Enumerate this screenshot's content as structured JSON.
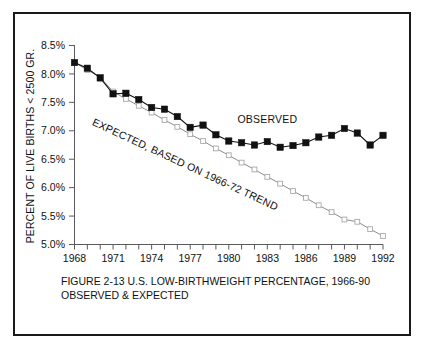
{
  "figure": {
    "caption_line1": "FIGURE 2-13  U.S. LOW-BIRTHWEIGHT PERCENTAGE, 1966-90",
    "caption_line2": "OBSERVED & EXPECTED"
  },
  "chart_data": {
    "type": "line",
    "title": "",
    "xlabel": "",
    "ylabel": "PERCENT OF LIVE BIRTHS < 2500 GR.",
    "xlim": [
      1968,
      1992
    ],
    "ylim": [
      5.0,
      8.5
    ],
    "ytick_labels": [
      "8.5%",
      "8.0%",
      "7.5%",
      "7.0%",
      "6.5%",
      "6.0%",
      "5.5%",
      "5.0%"
    ],
    "ytick_values": [
      8.5,
      8.0,
      7.5,
      7.0,
      6.5,
      6.0,
      5.5,
      5.0
    ],
    "xtick_labels": [
      "1968",
      "1971",
      "1974",
      "1977",
      "1980",
      "1983",
      "1986",
      "1989",
      "1992"
    ],
    "xtick_values": [
      1968,
      1971,
      1974,
      1977,
      1980,
      1983,
      1986,
      1989,
      1992
    ],
    "xminor_values": [
      1968,
      1969,
      1970,
      1971,
      1972,
      1973,
      1974,
      1975,
      1976,
      1977,
      1978,
      1979,
      1980,
      1981,
      1982,
      1983,
      1984,
      1985,
      1986,
      1987,
      1988,
      1989,
      1990,
      1991,
      1992
    ],
    "grid": false,
    "legend_position": "inline-annotation",
    "annotations": [
      {
        "text": "OBSERVED",
        "x": 1983.0,
        "y": 7.13,
        "rotation": 0
      },
      {
        "text": "EXPECTED, BASED ON 1966-72 TREND",
        "x": 1976.5,
        "y": 6.35,
        "rotation": 25
      }
    ],
    "x": [
      1968,
      1969,
      1970,
      1971,
      1972,
      1973,
      1974,
      1975,
      1976,
      1977,
      1978,
      1979,
      1980,
      1981,
      1982,
      1983,
      1984,
      1985,
      1986,
      1987,
      1988,
      1989,
      1990,
      1991,
      1992
    ],
    "series": [
      {
        "name": "OBSERVED",
        "marker": "filled-square",
        "color": "#111111",
        "values": [
          8.2,
          8.1,
          7.93,
          7.65,
          7.66,
          7.55,
          7.41,
          7.38,
          7.25,
          7.06,
          7.1,
          6.93,
          6.82,
          6.79,
          6.75,
          6.81,
          6.71,
          6.74,
          6.79,
          6.89,
          6.92,
          7.04,
          6.96,
          6.75,
          6.92
        ]
      },
      {
        "name": "EXPECTED, BASED ON 1966-72 TREND",
        "marker": "open-square",
        "color": "#8c8c8c",
        "values": [
          8.2,
          8.07,
          7.94,
          7.69,
          7.56,
          7.44,
          7.32,
          7.19,
          7.07,
          6.94,
          6.82,
          6.69,
          6.57,
          6.44,
          6.32,
          6.19,
          6.07,
          5.94,
          5.82,
          5.69,
          5.57,
          5.44,
          5.4,
          5.27,
          5.15
        ]
      }
    ]
  }
}
